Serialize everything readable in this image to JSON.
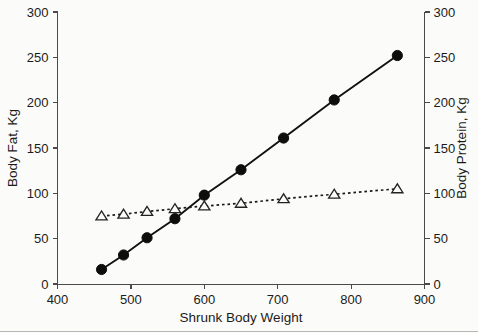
{
  "chart_data": {
    "type": "line",
    "title": "",
    "xlabel": "Shrunk Body Weight",
    "ylabel": "Body Fat, Kg",
    "y2label": "Body Protein, Kg",
    "xlim": [
      400,
      900
    ],
    "ylim": [
      0,
      300
    ],
    "y2lim": [
      0,
      300
    ],
    "xticks": [
      400,
      500,
      600,
      700,
      800,
      900
    ],
    "yticks": [
      0,
      50,
      100,
      150,
      200,
      250,
      300
    ],
    "y2ticks": [
      0,
      50,
      100,
      150,
      200,
      250,
      300
    ],
    "xticklabels": [
      "400",
      "500",
      "600",
      "700",
      "800",
      "900"
    ],
    "yticklabels": [
      "0",
      "50",
      "100",
      "150",
      "200",
      "250",
      "300"
    ],
    "y2ticklabels": [
      "0",
      "50",
      "100",
      "150",
      "200",
      "250",
      "300"
    ],
    "grid": false,
    "legend": "none",
    "x": [
      460,
      490,
      522,
      560,
      600,
      650,
      708,
      777,
      863
    ],
    "series": [
      {
        "name": "Body Fat, Kg",
        "axis": "left",
        "marker": "filled-circle",
        "linestyle": "solid",
        "values": [
          16,
          32,
          51,
          72,
          98,
          126,
          161,
          203,
          252
        ]
      },
      {
        "name": "Body Protein, Kg",
        "axis": "right",
        "marker": "open-triangle",
        "linestyle": "dotted",
        "values": [
          75,
          77,
          80,
          83,
          86,
          89,
          94,
          99,
          105
        ]
      }
    ]
  },
  "colors": {
    "background": "#fbfbf9",
    "axis": "#4a4a4a",
    "text": "#1b1b1b",
    "series_fat": "#0d0d0d",
    "series_protein": "#222222",
    "bottom_rule": "#b9b9b4"
  }
}
